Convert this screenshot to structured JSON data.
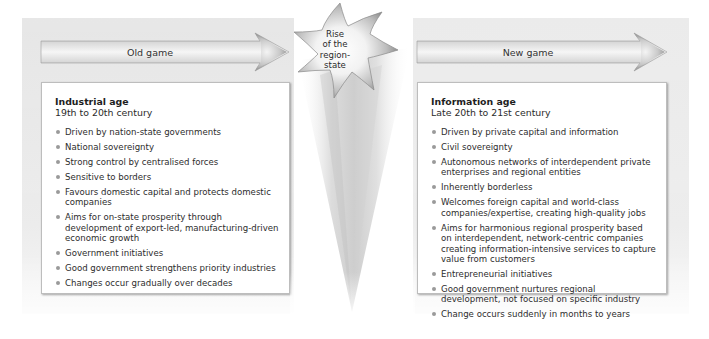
{
  "center": {
    "star_label_lines": [
      "Rise",
      "of the",
      "region-",
      "state"
    ]
  },
  "left": {
    "arrow_label": "Old game",
    "title": "Industrial age",
    "subtitle": "19th to 20th century",
    "items": [
      "Driven by nation-state governments",
      "National sovereignty",
      "Strong control by centralised forces",
      "Sensitive to borders",
      "Favours domestic capital and protects domestic companies",
      "Aims for on-state prosperity through development of export-led, manufacturing-driven economic growth",
      "Government initiatives",
      "Good government strengthens priority industries",
      "Changes occur gradually over decades"
    ]
  },
  "right": {
    "arrow_label": "New game",
    "title": "Information age",
    "subtitle": "Late 20th to 21st century",
    "items": [
      "Driven by private capital and information",
      "Civil sovereignty",
      "Autonomous networks of interdependent private enterprises and regional entities",
      "Inherently borderless",
      "Welcomes foreign capital and world-class companies/expertise, creating high-quality jobs",
      "Aims for harmonious regional prosperity based on interdependent, network-centric companies creating information-intensive services to capture value from customers",
      "Entrepreneurial initiatives",
      "Good government nurtures regional development, not focused on specific industry",
      "Change occurs suddenly in months to years"
    ]
  },
  "colors": {
    "panel_bg": "#e8e8e8",
    "arrow_fill_light": "#f4f4f4",
    "arrow_fill_dark": "#8c8c8c",
    "bullet": "#9a9a9a",
    "text": "#2b2b2b"
  }
}
